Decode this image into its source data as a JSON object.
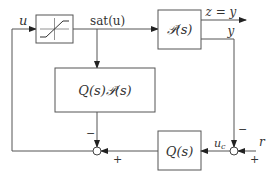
{
  "diagram": {
    "blocks": {
      "saturation": {
        "label": "saturation",
        "icon": "saturation-icon"
      },
      "plant": {
        "label": "𝒫(s)"
      },
      "qp": {
        "label": "Q(s)𝒫(s)"
      },
      "q": {
        "label": "Q(s)"
      }
    },
    "signals": {
      "u": "u",
      "sat_u": "sat(u)",
      "z_eq_y": "z = y",
      "y": "y",
      "u_c": "u",
      "u_c_sub": "c",
      "r": "r"
    },
    "signs": {
      "right_sum_top": "−",
      "right_sum_right": "+",
      "left_sum_top": "−",
      "left_sum_right": "+"
    },
    "colors": {
      "line": "#555555",
      "text": "#333333",
      "background": "#ffffff"
    }
  }
}
